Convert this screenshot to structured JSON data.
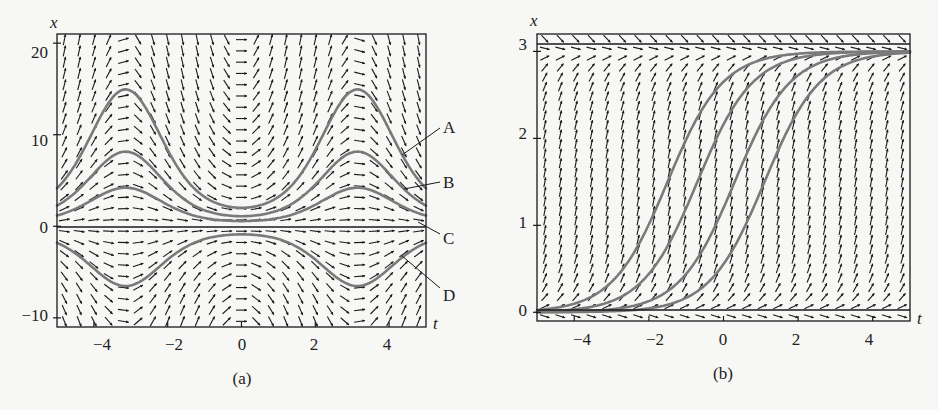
{
  "figure": {
    "panels": [
      {
        "id": "a",
        "caption": "(a)",
        "xlabel": "t",
        "ylabel": "x",
        "xticks": [
          "−4",
          "−2",
          "0",
          "2",
          "4"
        ],
        "yticks": [
          "20",
          "10",
          "0",
          "−10"
        ],
        "curve_labels": [
          "A",
          "B",
          "C",
          "D"
        ]
      },
      {
        "id": "b",
        "caption": "(b)",
        "xlabel": "t",
        "ylabel": "x",
        "xticks": [
          "−4",
          "−2",
          "0",
          "2",
          "4"
        ],
        "yticks": [
          "3",
          "2",
          "1",
          "0"
        ]
      }
    ]
  },
  "colors": {
    "background": "#f7f7f5",
    "frame": "#1a1a1a",
    "arrows": "#1a1a1a",
    "solution_curves": "#7a7a7a"
  },
  "chart_data": [
    {
      "type": "line",
      "subtype": "direction-field",
      "title": "(a)",
      "xlabel": "t",
      "ylabel": "x",
      "xlim": [
        -5,
        5
      ],
      "ylim": [
        -11,
        21
      ],
      "xticks": [
        -4,
        -2,
        0,
        2,
        4
      ],
      "yticks": [
        -10,
        0,
        10,
        20
      ],
      "grid": false,
      "legend": "curve labels A–D at right edge with leader lines",
      "equilibrium": [
        {
          "x": 0,
          "style": "solid black horizontal line"
        }
      ],
      "series": [
        {
          "name": "A",
          "form": "x = C·e^(−cos t)",
          "C": 5.5,
          "t": [
            -5,
            -4,
            -3.14,
            -2,
            -1,
            0,
            1,
            2,
            3.14,
            4,
            5
          ],
          "x": [
            4.1,
            10.6,
            15.0,
            8.4,
            3.2,
            2.0,
            3.2,
            8.4,
            15.0,
            10.6,
            4.1
          ]
        },
        {
          "name": "B",
          "form": "x = C·e^(−cos t)",
          "C": 3.0,
          "t": [
            -5,
            -4,
            -3.14,
            -2,
            -1,
            0,
            1,
            2,
            3.14,
            4,
            5
          ],
          "x": [
            2.3,
            5.8,
            8.2,
            4.6,
            1.7,
            1.1,
            1.7,
            4.6,
            8.2,
            5.8,
            2.3
          ]
        },
        {
          "name": "C",
          "form": "x = C·e^(−cos t)",
          "C": 1.55,
          "t": [
            -5,
            -4,
            -3.14,
            -2,
            -1,
            0,
            1,
            2,
            3.14,
            4,
            5
          ],
          "x": [
            1.2,
            3.0,
            4.2,
            2.4,
            0.9,
            0.6,
            0.9,
            2.4,
            4.2,
            3.0,
            1.2
          ]
        },
        {
          "name": "D",
          "form": "x = C·e^(−cos t)",
          "C": -2.4,
          "t": [
            -5,
            -4,
            -3.14,
            -2,
            -1,
            0,
            1,
            2,
            3.14,
            4,
            5
          ],
          "x": [
            -1.8,
            -4.6,
            -6.5,
            -3.6,
            -1.4,
            -0.9,
            -1.4,
            -3.6,
            -6.5,
            -4.6,
            -1.8
          ]
        }
      ],
      "field": "slopes ≈ x·sin t (arrows point right, steep near t=±π/2·odd, flat near t=0 and t=±π)"
    },
    {
      "type": "line",
      "subtype": "direction-field",
      "title": "(b)",
      "xlabel": "t",
      "ylabel": "x",
      "xlim": [
        -5,
        5
      ],
      "ylim": [
        -0.1,
        3.2
      ],
      "xticks": [
        -4,
        -2,
        0,
        2,
        4
      ],
      "yticks": [
        0,
        1,
        2,
        3
      ],
      "grid": false,
      "equilibria": [
        {
          "x": 0,
          "style": "solid black horizontal line"
        },
        {
          "x": 3,
          "style": "solid black horizontal line"
        }
      ],
      "series": [
        {
          "name": "curve 1",
          "form": "logistic, K=3",
          "midpoint_t": -1.5,
          "t": [
            -5,
            -3,
            -2,
            -1.5,
            -1,
            0,
            1,
            3,
            5
          ],
          "x": [
            0.05,
            0.45,
            1.05,
            1.5,
            1.95,
            2.6,
            2.9,
            3.0,
            3.0
          ]
        },
        {
          "name": "curve 2",
          "form": "logistic, K=3",
          "midpoint_t": -0.7,
          "t": [
            -5,
            -3,
            -2,
            -0.7,
            0,
            1,
            3,
            5
          ],
          "x": [
            0.03,
            0.22,
            0.55,
            1.5,
            2.1,
            2.7,
            2.98,
            3.0
          ]
        },
        {
          "name": "curve 3",
          "form": "logistic, K=3",
          "midpoint_t": 0.3,
          "t": [
            -5,
            -3,
            -1,
            0,
            0.3,
            1,
            2,
            3,
            5
          ],
          "x": [
            0.02,
            0.09,
            0.55,
            1.2,
            1.5,
            2.15,
            2.7,
            2.9,
            3.0
          ]
        },
        {
          "name": "curve 4",
          "form": "logistic, K=3",
          "midpoint_t": 1.1,
          "t": [
            -5,
            -3,
            -1,
            0,
            1.1,
            2,
            3,
            5
          ],
          "x": [
            0.01,
            0.04,
            0.27,
            0.7,
            1.5,
            2.25,
            2.7,
            2.97
          ]
        }
      ],
      "field": "slopes ≈ x(3−x), steep near x=1.5, flat near x=0 and x=3"
    }
  ]
}
